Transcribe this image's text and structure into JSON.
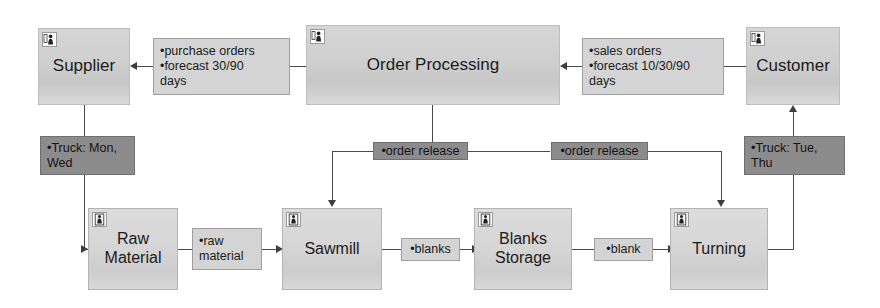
{
  "diagram": {
    "colors": {
      "actor_fill": "#cfcfcf",
      "process_fill": "#d5d5d5",
      "info_fill": "#d4d4d4",
      "dark_fill": "#8c8c8c",
      "line": "#4a4a4a",
      "background": "#ffffff"
    }
  },
  "nodes": {
    "supplier": {
      "label": "Supplier",
      "icon": "actor-person-icon"
    },
    "order_processing": {
      "label": "Order Processing",
      "icon": "actor-person-icon"
    },
    "customer": {
      "label": "Customer",
      "icon": "actor-person-icon"
    },
    "raw_material": {
      "label": "Raw\nMaterial",
      "line1": "Raw",
      "line2": "Material",
      "icon": "process-person-icon"
    },
    "sawmill": {
      "label": "Sawmill",
      "icon": "process-person-icon"
    },
    "blanks_storage": {
      "label": "Blanks\nStorage",
      "line1": "Blanks",
      "line2": "Storage",
      "icon": "process-person-icon"
    },
    "turning": {
      "label": "Turning",
      "icon": "process-person-icon"
    }
  },
  "info_boxes": {
    "purchase_orders": {
      "line1": "•purchase orders",
      "line2": "•forecast 30/90",
      "line3": "days"
    },
    "sales_orders": {
      "line1": "•sales orders",
      "line2": "•forecast 10/30/90",
      "line3": "days"
    },
    "truck_left": {
      "line1": "•Truck: Mon,",
      "line2": "Wed"
    },
    "truck_right": {
      "line1": "•Truck: Tue,",
      "line2": "Thu"
    },
    "order_release_left": {
      "label": "•order release"
    },
    "order_release_right": {
      "label": "•order release"
    },
    "raw_material_flow": {
      "line1": "•raw",
      "line2": "material"
    },
    "blanks_flow": {
      "label": "•blanks"
    },
    "blank_flow": {
      "label": "•blank"
    }
  }
}
